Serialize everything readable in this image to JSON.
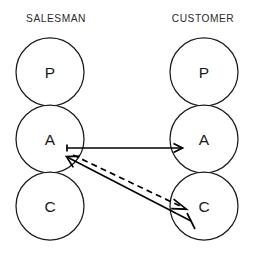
{
  "diagram": {
    "background_color": "#ffffff",
    "line_color": "#000000",
    "text_color": "#1a1a1a",
    "heading_color": "#2b2b2b",
    "columns": [
      {
        "id": "salesman",
        "heading": "SALESMAN",
        "center_x": 50,
        "heading_x": 56,
        "heading_y": 22,
        "states": [
          {
            "id": "salesman-parent",
            "letter": "P",
            "cy": 72
          },
          {
            "id": "salesman-adult",
            "letter": "A",
            "cy": 139
          },
          {
            "id": "salesman-child",
            "letter": "C",
            "cy": 206
          }
        ]
      },
      {
        "id": "customer",
        "heading": "CUSTOMER",
        "center_x": 204,
        "heading_x": 203,
        "heading_y": 22,
        "states": [
          {
            "id": "customer-parent",
            "letter": "P",
            "cy": 72
          },
          {
            "id": "customer-adult",
            "letter": "A",
            "cy": 139
          },
          {
            "id": "customer-child",
            "letter": "C",
            "cy": 206
          }
        ]
      }
    ],
    "circle_radius": 34,
    "transactions": [
      {
        "id": "salesman-adult-to-customer-adult",
        "label": "Adult to Adult",
        "style": "solid",
        "from": "salesman-adult",
        "to": "customer-adult",
        "x1": 67,
        "y1": 148,
        "x2": 182,
        "y2": 148,
        "head": "end"
      },
      {
        "id": "customer-child-to-salesman-adult",
        "label": "Child to Adult",
        "style": "solid",
        "from": "customer-child",
        "to": "salesman-adult",
        "x1": 191,
        "y1": 221,
        "x2": 67,
        "y2": 157,
        "head": "end"
      },
      {
        "id": "salesman-adult-to-customer-child",
        "label": "Adult to Child",
        "style": "dashed",
        "from": "salesman-adult",
        "to": "customer-child",
        "x1": 73,
        "y1": 155,
        "x2": 186,
        "y2": 209,
        "head": "end"
      }
    ]
  }
}
